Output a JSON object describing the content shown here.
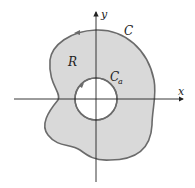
{
  "diagram": {
    "axes": {
      "x_label": "x",
      "y_label": "y"
    },
    "labels": {
      "outer_curve": "C",
      "region": "R",
      "inner_curve_main": "C",
      "inner_curve_sub": "a"
    },
    "colors": {
      "region_fill": "#d9d9d9",
      "curve_stroke": "#6b6b6b",
      "axis": "#222222",
      "hole_fill": "#ffffff"
    }
  }
}
